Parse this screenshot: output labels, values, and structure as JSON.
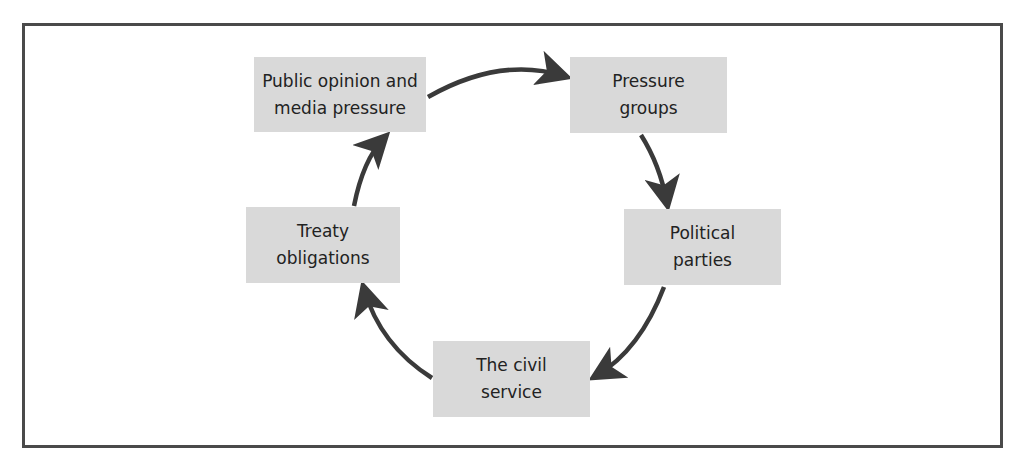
{
  "diagram": {
    "type": "cycle",
    "colors": {
      "box_fill": "#d9d9d9",
      "arrow": "#3a3a3a",
      "frame": "#4a4a4a",
      "text": "#222222"
    },
    "nodes": [
      {
        "id": "public-opinion",
        "label": "Public opinion and\nmedia pressure"
      },
      {
        "id": "pressure-groups",
        "label": "Pressure\ngroups"
      },
      {
        "id": "political-parties",
        "label": "Political\nparties"
      },
      {
        "id": "civil-service",
        "label": "The civil\nservice"
      },
      {
        "id": "treaty-obligations",
        "label": "Treaty\nobligations"
      }
    ],
    "edges": [
      {
        "from": "public-opinion",
        "to": "pressure-groups"
      },
      {
        "from": "pressure-groups",
        "to": "political-parties"
      },
      {
        "from": "political-parties",
        "to": "civil-service"
      },
      {
        "from": "civil-service",
        "to": "treaty-obligations"
      },
      {
        "from": "treaty-obligations",
        "to": "public-opinion"
      }
    ]
  }
}
